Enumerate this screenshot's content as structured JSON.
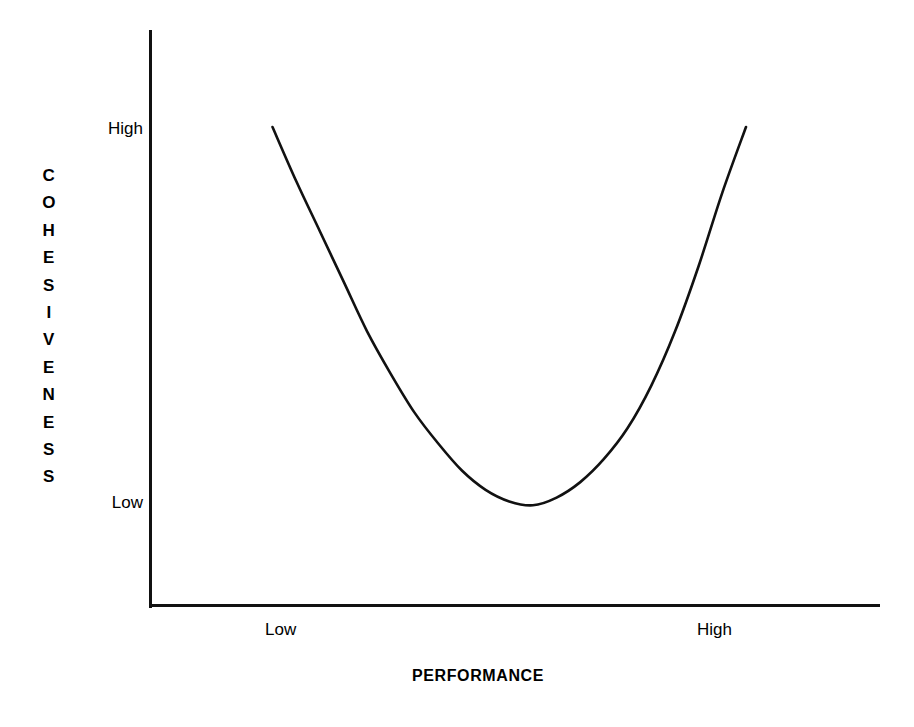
{
  "figure": {
    "background_color": "#ffffff",
    "line_color": "#111111"
  },
  "axes": {
    "y_axis_title": "COHESIVENESS",
    "x_axis_title": "PERFORMANCE",
    "y_tick_labels": [
      "High",
      "Low"
    ],
    "x_tick_labels": [
      "Low",
      "High"
    ]
  },
  "chart_data": {
    "type": "line",
    "title": "",
    "subtitle": "",
    "xlabel": "PERFORMANCE",
    "ylabel": "COHESIVENESS",
    "grid": false,
    "legend": null,
    "x_tick_labels": [
      "Low",
      "High"
    ],
    "y_tick_labels": [
      "Low",
      "High"
    ],
    "xlim": [
      "Low",
      "High"
    ],
    "ylim": [
      "Low",
      "High"
    ],
    "annotations": [],
    "series": [
      {
        "name": "Cohesiveness vs Performance",
        "shape": "U-curve",
        "description": "Cohesiveness is High at both Low and High performance, and dips to Low at intermediate performance.",
        "x": [
          0.0,
          0.05,
          0.1,
          0.15,
          0.2,
          0.25,
          0.3,
          0.35,
          0.4,
          0.45,
          0.5,
          0.55,
          0.6,
          0.65,
          0.7,
          0.75,
          0.8,
          0.85,
          0.9,
          0.95,
          1.0
        ],
        "y": [
          1.0,
          0.86,
          0.73,
          0.6,
          0.47,
          0.36,
          0.26,
          0.18,
          0.11,
          0.06,
          0.03,
          0.02,
          0.04,
          0.08,
          0.14,
          0.22,
          0.33,
          0.47,
          0.64,
          0.83,
          1.0
        ]
      }
    ]
  }
}
